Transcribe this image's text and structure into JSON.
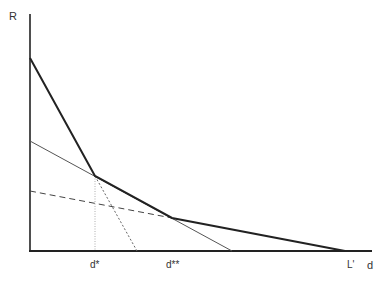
{
  "diagram": {
    "axis_labels": {
      "y": "R",
      "x": "d"
    },
    "tick_labels": {
      "d_star": "d*",
      "d_double_star": "d**",
      "l_prime": "L'"
    },
    "lines": [
      {
        "name": "bold-kinked-curve",
        "style": "solid-thick",
        "points": [
          [
            30,
            58
          ],
          [
            95,
            176
          ],
          [
            172,
            218
          ],
          [
            345,
            251
          ]
        ]
      },
      {
        "name": "thin-solid-line",
        "style": "solid-thin",
        "points": [
          [
            30,
            141
          ],
          [
            232,
            251
          ]
        ]
      },
      {
        "name": "dashed-line",
        "style": "dashed",
        "points": [
          [
            30,
            191
          ],
          [
            172,
            218
          ]
        ]
      },
      {
        "name": "dotted-steep-line",
        "style": "dotted",
        "points": [
          [
            95,
            176
          ],
          [
            137,
            251
          ]
        ]
      },
      {
        "name": "vertical-guide-d-star",
        "style": "dotted-thin",
        "points": [
          [
            95,
            176
          ],
          [
            95,
            251
          ]
        ]
      }
    ],
    "colors": {
      "axis": "#222222",
      "bold_line": "#222222",
      "thin_line": "#555555",
      "dashed_line": "#444444",
      "text": "#333333"
    }
  }
}
